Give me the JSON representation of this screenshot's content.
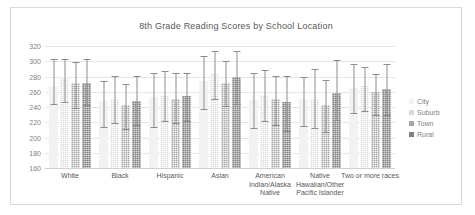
{
  "chart_data": {
    "type": "bar",
    "title": "8th Grade Reading Scores by School Location",
    "xlabel": "",
    "ylabel": "",
    "ylim": [
      160,
      320
    ],
    "yticks": [
      160,
      180,
      200,
      220,
      240,
      260,
      280,
      300,
      320
    ],
    "grid": true,
    "legend_position": "right",
    "categories": [
      "White",
      "Black",
      "Hispanic",
      "Asian",
      "American Indian/Alaska Native",
      "Native Hawaiian/Other Pacific Islander",
      "Two or more races"
    ],
    "series": [
      {
        "name": "City",
        "color": "#f2f2f2",
        "values": [
          268,
          248,
          253,
          274,
          249,
          251,
          265
        ],
        "error_low": [
          244,
          214,
          214,
          237,
          212,
          215,
          232
        ],
        "error_high": [
          303,
          274,
          284,
          307,
          285,
          280,
          297
        ]
      },
      {
        "name": "Suburb",
        "color": "#d9d9d9",
        "values": [
          279,
          251,
          254,
          283,
          256,
          251,
          268
        ],
        "error_low": [
          246,
          219,
          221,
          250,
          221,
          212,
          235
        ],
        "error_high": [
          303,
          281,
          287,
          313,
          289,
          290,
          292
        ]
      },
      {
        "name": "Town",
        "color": "#a6a6a6",
        "values": [
          271,
          243,
          250,
          272,
          250,
          243,
          260
        ],
        "error_low": [
          239,
          211,
          219,
          241,
          216,
          207,
          229
        ],
        "error_high": [
          299,
          270,
          284,
          300,
          281,
          275,
          283
        ]
      },
      {
        "name": "Rural",
        "color": "#808080",
        "values": [
          272,
          248,
          254,
          279,
          246,
          259,
          263
        ],
        "error_low": [
          242,
          217,
          222,
          244,
          209,
          223,
          230
        ],
        "error_high": [
          303,
          281,
          285,
          313,
          281,
          302,
          296
        ]
      }
    ]
  },
  "legend": {
    "items": [
      {
        "label": "City"
      },
      {
        "label": "Suburb"
      },
      {
        "label": "Town"
      },
      {
        "label": "Rural"
      }
    ]
  }
}
